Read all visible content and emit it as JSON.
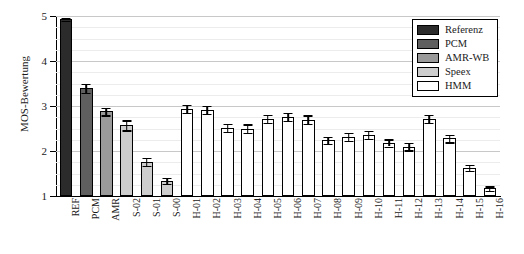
{
  "chart_data": {
    "type": "bar",
    "title": "",
    "xlabel": "",
    "ylabel": "MOS-Bewertung",
    "ylim": [
      1,
      5
    ],
    "yticks": [
      1,
      2,
      3,
      4,
      5
    ],
    "ytick_labels": [
      "1",
      "2",
      "3",
      "4",
      "5"
    ],
    "grid": true,
    "legend_position": "upper right",
    "legend": [
      {
        "label": "Referenz",
        "color": "#2b2b2b"
      },
      {
        "label": "PCM",
        "color": "#5f5f5f"
      },
      {
        "label": "AMR-WB",
        "color": "#9a9a9a"
      },
      {
        "label": "Speex",
        "color": "#cdcdcd"
      },
      {
        "label": "HMM",
        "color": "#ffffff"
      }
    ],
    "categories": [
      "REF",
      "PCM",
      "AMR",
      "S-02",
      "S-01",
      "S-00",
      "H-01",
      "H-02",
      "H-03",
      "H-04",
      "H-05",
      "H-06",
      "H-07",
      "H-08",
      "H-09",
      "H-10",
      "H-11",
      "H-12",
      "H-13",
      "H-14",
      "H-15",
      "H-16"
    ],
    "values": [
      4.93,
      3.4,
      2.88,
      2.57,
      1.76,
      1.34,
      2.94,
      2.92,
      2.52,
      2.5,
      2.72,
      2.76,
      2.7,
      2.24,
      2.32,
      2.36,
      2.18,
      2.1,
      2.72,
      2.28,
      1.63,
      1.17
    ],
    "errors": [
      0.03,
      0.1,
      0.08,
      0.11,
      0.09,
      0.07,
      0.09,
      0.09,
      0.09,
      0.09,
      0.09,
      0.09,
      0.09,
      0.08,
      0.09,
      0.09,
      0.08,
      0.08,
      0.09,
      0.08,
      0.07,
      0.05
    ],
    "series_of": [
      "Referenz",
      "PCM",
      "AMR-WB",
      "Speex",
      "Speex",
      "Speex",
      "HMM",
      "HMM",
      "HMM",
      "HMM",
      "HMM",
      "HMM",
      "HMM",
      "HMM",
      "HMM",
      "HMM",
      "HMM",
      "HMM",
      "HMM",
      "HMM",
      "HMM",
      "HMM"
    ],
    "colors": [
      "#2b2b2b",
      "#5f5f5f",
      "#9a9a9a",
      "#cdcdcd",
      "#cdcdcd",
      "#cdcdcd",
      "#ffffff",
      "#ffffff",
      "#ffffff",
      "#ffffff",
      "#ffffff",
      "#ffffff",
      "#ffffff",
      "#ffffff",
      "#ffffff",
      "#ffffff",
      "#ffffff",
      "#ffffff",
      "#ffffff",
      "#ffffff",
      "#ffffff",
      "#ffffff"
    ]
  }
}
